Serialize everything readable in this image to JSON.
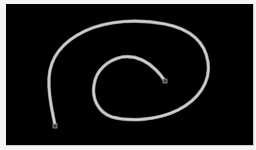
{
  "canvas": {
    "background": "#000000",
    "frame_color": "#f4f4f4"
  },
  "curve": {
    "shape": "spiral",
    "stroke_color": "#bdbdbd",
    "highlight_color": "#e6e6e6",
    "stroke_width": 2.6,
    "path": "M55,125 C52,110 48,95 49,78 C50,58 62,42 85,31 C108,20 140,19 165,24 C190,29 205,42 208,62 C211,82 198,100 178,110 C158,120 130,122 112,117 C97,112 92,97 94,85 C96,70 108,60 122,57 C136,55 148,62 156,70 C160,74 163,78 165,81",
    "start_marker": {
      "x": 55,
      "y": 126,
      "size": 4
    },
    "end_marker": {
      "x": 165,
      "y": 81,
      "size": 4
    }
  }
}
